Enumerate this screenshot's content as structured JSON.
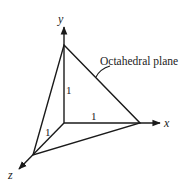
{
  "diagram": {
    "title": "Octahedral plane",
    "callout_label": "Octahedral plane",
    "axes": {
      "x": {
        "label": "x"
      },
      "y": {
        "label": "y"
      },
      "z": {
        "label": "z"
      }
    },
    "intercepts": {
      "x": "1",
      "y": "1",
      "z": "1"
    },
    "colors": {
      "line": "#1a1a1a",
      "text": "#222222",
      "background": "#ffffff"
    }
  }
}
